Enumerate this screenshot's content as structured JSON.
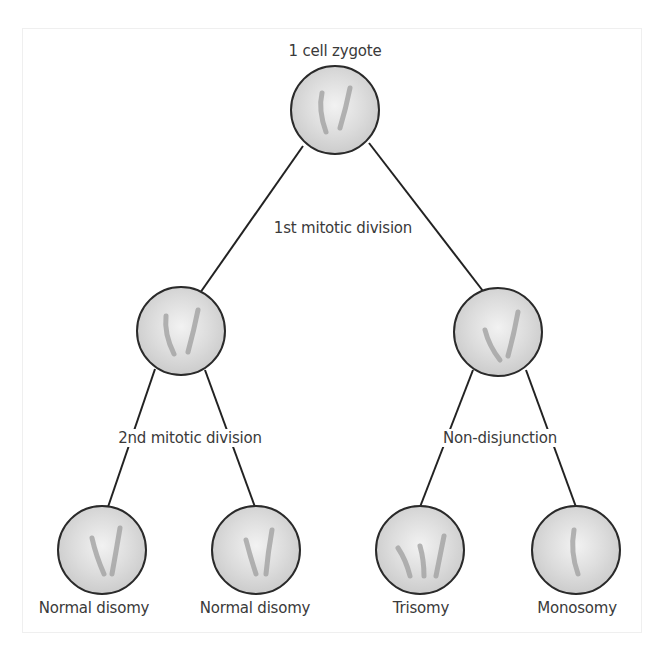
{
  "diagram": {
    "type": "tree",
    "colors": {
      "line": "#222222",
      "cell_fill": "#d6d6d6",
      "cell_fill_center": "#f0f0f0",
      "cell_stroke": "#2a2a2a",
      "chromosome": "#9a9a9a",
      "text": "#3a3a3a",
      "frame": "#efefef"
    },
    "root": {
      "label": "1 cell zygote",
      "cx": 335,
      "cy": 110,
      "r": 44
    },
    "edge_labels": {
      "first": "1st mitotic division",
      "second": "2nd mitotic division",
      "nondisjunction": "Non-disjunction"
    },
    "middle": [
      {
        "id": "mid-left",
        "cx": 181,
        "cy": 331,
        "r": 44
      },
      {
        "id": "mid-right",
        "cx": 498,
        "cy": 332,
        "r": 44
      }
    ],
    "leaves": [
      {
        "id": "leaf-1",
        "label": "Normal disomy",
        "cx": 102,
        "cy": 550,
        "r": 44,
        "chromosomes": 2
      },
      {
        "id": "leaf-2",
        "label": "Normal disomy",
        "cx": 256,
        "cy": 550,
        "r": 44,
        "chromosomes": 2
      },
      {
        "id": "leaf-3",
        "label": "Trisomy",
        "cx": 420,
        "cy": 550,
        "r": 44,
        "chromosomes": 3
      },
      {
        "id": "leaf-4",
        "label": "Monosomy",
        "cx": 576,
        "cy": 550,
        "r": 44,
        "chromosomes": 1
      }
    ]
  }
}
